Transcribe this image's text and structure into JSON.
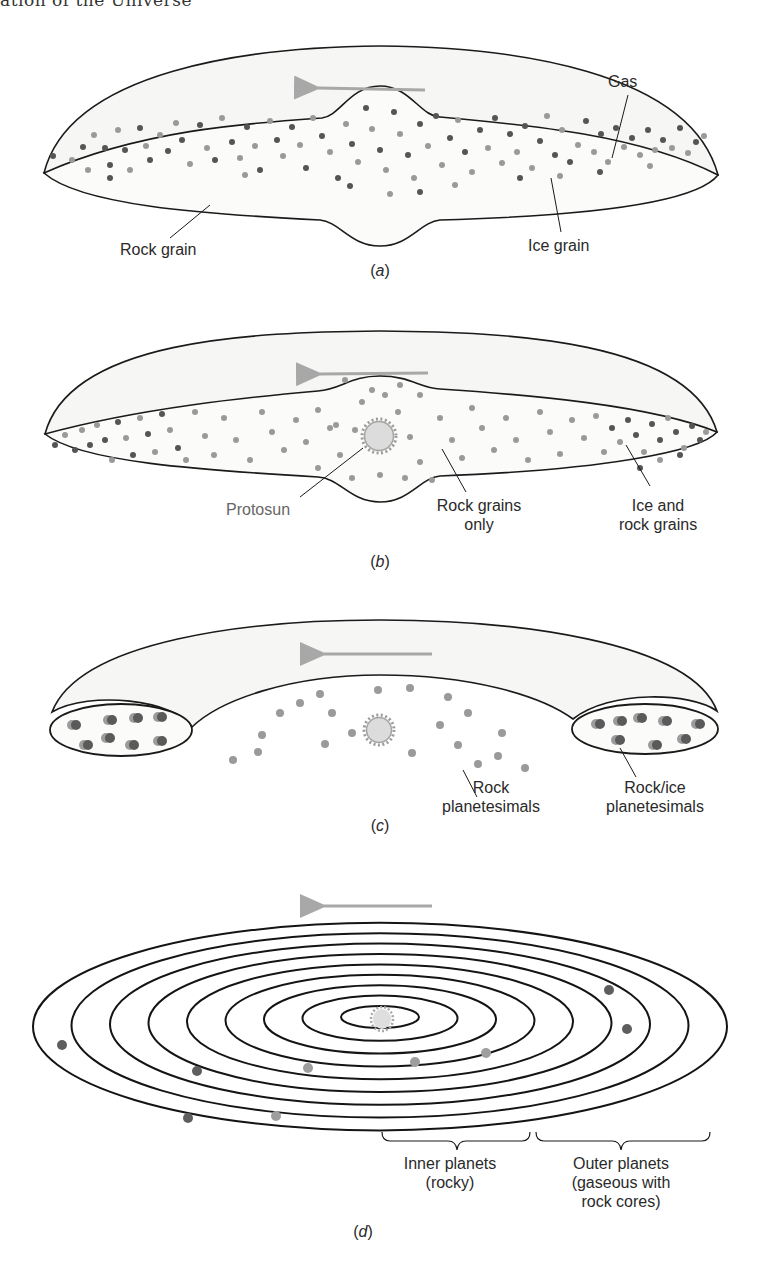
{
  "header": {
    "running_title": "ation of the Universe"
  },
  "colors": {
    "outline": "#1a1a1a",
    "gas_fill": "#f6f6f4",
    "disk_fill": "#fbfbfa",
    "rock_grain": "#9a9a9a",
    "ice_grain": "#555555",
    "arrow": "#a8a8a8",
    "protosun_fill": "#dcdcdc",
    "protosun_rim": "#9c9c9c",
    "label_text": "#2a2a2a",
    "protosun_label_text": "#666666"
  },
  "panels": [
    {
      "id": "a",
      "caption_prefix": "(",
      "caption_letter": "a",
      "caption_suffix": ")",
      "labels": {
        "gas": "Gas",
        "rock_grain": "Rock grain",
        "ice_grain": "Ice grain"
      },
      "rotation_arrow": "counterclockwise (pointing left)"
    },
    {
      "id": "b",
      "caption_prefix": "(",
      "caption_letter": "b",
      "caption_suffix": ")",
      "labels": {
        "protosun": "Protosun",
        "rock_only_line1": "Rock grains",
        "rock_only_line2": "only",
        "ice_rock_line1": "Ice and",
        "ice_rock_line2": "rock grains"
      }
    },
    {
      "id": "c",
      "caption_prefix": "(",
      "caption_letter": "c",
      "caption_suffix": ")",
      "labels": {
        "rock_pl_line1": "Rock",
        "rock_pl_line2": "planetesimals",
        "rockice_pl_line1": "Rock/ice",
        "rockice_pl_line2": "planetesimals"
      }
    },
    {
      "id": "d",
      "caption_prefix": "(",
      "caption_letter": "d",
      "caption_suffix": ")",
      "orbit_count": 9,
      "labels": {
        "inner_line1": "Inner planets",
        "inner_line2": "(rocky)",
        "outer_line1": "Outer planets",
        "outer_line2": "(gaseous with",
        "outer_line3": "rock cores)"
      }
    }
  ],
  "grains_a": [
    [
      53,
      156,
      "i"
    ],
    [
      72,
      160,
      "r"
    ],
    [
      83,
      147,
      "i"
    ],
    [
      94,
      135,
      "r"
    ],
    [
      105,
      148,
      "i"
    ],
    [
      88,
      170,
      "r"
    ],
    [
      110,
      165,
      "i"
    ],
    [
      118,
      130,
      "r"
    ],
    [
      125,
      150,
      "i"
    ],
    [
      130,
      170,
      "r"
    ],
    [
      140,
      128,
      "i"
    ],
    [
      146,
      146,
      "r"
    ],
    [
      150,
      160,
      "i"
    ],
    [
      160,
      135,
      "r"
    ],
    [
      168,
      151,
      "i"
    ],
    [
      176,
      123,
      "r"
    ],
    [
      182,
      140,
      "i"
    ],
    [
      190,
      164,
      "r"
    ],
    [
      200,
      125,
      "i"
    ],
    [
      207,
      148,
      "r"
    ],
    [
      215,
      160,
      "i"
    ],
    [
      222,
      118,
      "r"
    ],
    [
      232,
      142,
      "i"
    ],
    [
      240,
      158,
      "r"
    ],
    [
      247,
      127,
      "i"
    ],
    [
      255,
      146,
      "r"
    ],
    [
      260,
      170,
      "i"
    ],
    [
      270,
      121,
      "r"
    ],
    [
      277,
      140,
      "i"
    ],
    [
      283,
      156,
      "r"
    ],
    [
      292,
      127,
      "i"
    ],
    [
      300,
      145,
      "r"
    ],
    [
      306,
      168,
      "i"
    ],
    [
      313,
      118,
      "r"
    ],
    [
      322,
      136,
      "i"
    ],
    [
      330,
      152,
      "r"
    ],
    [
      338,
      178,
      "i"
    ],
    [
      346,
      124,
      "r"
    ],
    [
      352,
      144,
      "i"
    ],
    [
      358,
      162,
      "r"
    ],
    [
      366,
      108,
      "i"
    ],
    [
      372,
      129,
      "r"
    ],
    [
      380,
      150,
      "i"
    ],
    [
      386,
      170,
      "r"
    ],
    [
      394,
      112,
      "i"
    ],
    [
      400,
      134,
      "r"
    ],
    [
      408,
      155,
      "i"
    ],
    [
      414,
      178,
      "r"
    ],
    [
      420,
      124,
      "i"
    ],
    [
      428,
      146,
      "r"
    ],
    [
      436,
      116,
      "i"
    ],
    [
      442,
      165,
      "r"
    ],
    [
      450,
      138,
      "i"
    ],
    [
      458,
      120,
      "r"
    ],
    [
      465,
      152,
      "i"
    ],
    [
      472,
      172,
      "r"
    ],
    [
      480,
      130,
      "i"
    ],
    [
      488,
      148,
      "r"
    ],
    [
      495,
      118,
      "i"
    ],
    [
      502,
      163,
      "r"
    ],
    [
      510,
      134,
      "i"
    ],
    [
      517,
      152,
      "r"
    ],
    [
      525,
      126,
      "i"
    ],
    [
      532,
      168,
      "r"
    ],
    [
      540,
      141,
      "i"
    ],
    [
      547,
      116,
      "r"
    ],
    [
      555,
      155,
      "i"
    ],
    [
      562,
      130,
      "r"
    ],
    [
      570,
      162,
      "i"
    ],
    [
      578,
      145,
      "r"
    ],
    [
      586,
      121,
      "i"
    ],
    [
      594,
      152,
      "r"
    ],
    [
      601,
      134,
      "i"
    ],
    [
      608,
      162,
      "r"
    ],
    [
      616,
      128,
      "i"
    ],
    [
      624,
      147,
      "r"
    ],
    [
      632,
      138,
      "i"
    ],
    [
      640,
      155,
      "r"
    ],
    [
      648,
      130,
      "i"
    ],
    [
      655,
      150,
      "r"
    ],
    [
      663,
      140,
      "i"
    ],
    [
      672,
      148,
      "r"
    ],
    [
      680,
      128,
      "i"
    ],
    [
      688,
      153,
      "r"
    ],
    [
      696,
      142,
      "i"
    ],
    [
      704,
      136,
      "r"
    ],
    [
      110,
      178,
      "i"
    ],
    [
      245,
      175,
      "r"
    ],
    [
      350,
      186,
      "i"
    ],
    [
      390,
      194,
      "r"
    ],
    [
      420,
      192,
      "i"
    ],
    [
      455,
      185,
      "r"
    ],
    [
      520,
      178,
      "i"
    ],
    [
      560,
      176,
      "r"
    ],
    [
      600,
      172,
      "i"
    ],
    [
      650,
      166,
      "r"
    ]
  ],
  "grains_b": [
    [
      55,
      445,
      "i"
    ],
    [
      65,
      435,
      "r"
    ],
    [
      75,
      450,
      "i"
    ],
    [
      82,
      430,
      "r"
    ],
    [
      90,
      445,
      "i"
    ],
    [
      97,
      425,
      "r"
    ],
    [
      105,
      440,
      "i"
    ],
    [
      112,
      460,
      "r"
    ],
    [
      118,
      422,
      "i"
    ],
    [
      126,
      438,
      "r"
    ],
    [
      133,
      455,
      "i"
    ],
    [
      140,
      418,
      "r"
    ],
    [
      148,
      434,
      "i"
    ],
    [
      155,
      452,
      "r"
    ],
    [
      162,
      414,
      "i"
    ],
    [
      170,
      430,
      "r"
    ],
    [
      178,
      448,
      "i"
    ],
    [
      186,
      460,
      "r"
    ],
    [
      195,
      412,
      "r"
    ],
    [
      205,
      436,
      "r"
    ],
    [
      214,
      455,
      "r"
    ],
    [
      224,
      418,
      "r"
    ],
    [
      236,
      440,
      "r"
    ],
    [
      250,
      460,
      "r"
    ],
    [
      262,
      412,
      "r"
    ],
    [
      272,
      432,
      "r"
    ],
    [
      284,
      450,
      "r"
    ],
    [
      296,
      420,
      "r"
    ],
    [
      306,
      442,
      "r"
    ],
    [
      318,
      410,
      "r"
    ],
    [
      330,
      428,
      "r"
    ],
    [
      340,
      455,
      "r"
    ],
    [
      352,
      478,
      "r"
    ],
    [
      362,
      402,
      "r"
    ],
    [
      372,
      390,
      "r"
    ],
    [
      385,
      395,
      "r"
    ],
    [
      398,
      412,
      "r"
    ],
    [
      410,
      437,
      "r"
    ],
    [
      420,
      462,
      "r"
    ],
    [
      432,
      480,
      "r"
    ],
    [
      440,
      418,
      "r"
    ],
    [
      452,
      440,
      "r"
    ],
    [
      462,
      458,
      "r"
    ],
    [
      472,
      408,
      "r"
    ],
    [
      482,
      428,
      "r"
    ],
    [
      494,
      450,
      "r"
    ],
    [
      506,
      418,
      "r"
    ],
    [
      516,
      440,
      "r"
    ],
    [
      528,
      460,
      "r"
    ],
    [
      540,
      412,
      "r"
    ],
    [
      550,
      432,
      "r"
    ],
    [
      560,
      454,
      "r"
    ],
    [
      572,
      420,
      "r"
    ],
    [
      584,
      438,
      "r"
    ],
    [
      596,
      416,
      "r"
    ],
    [
      604,
      452,
      "r"
    ],
    [
      612,
      428,
      "i"
    ],
    [
      620,
      442,
      "r"
    ],
    [
      628,
      420,
      "i"
    ],
    [
      636,
      435,
      "i"
    ],
    [
      644,
      452,
      "r"
    ],
    [
      652,
      424,
      "i"
    ],
    [
      660,
      440,
      "i"
    ],
    [
      668,
      418,
      "r"
    ],
    [
      676,
      432,
      "i"
    ],
    [
      684,
      448,
      "r"
    ],
    [
      692,
      426,
      "i"
    ],
    [
      700,
      440,
      "i"
    ],
    [
      706,
      432,
      "r"
    ],
    [
      640,
      468,
      "i"
    ],
    [
      660,
      460,
      "r"
    ],
    [
      680,
      455,
      "i"
    ],
    [
      336,
      425,
      "r"
    ],
    [
      355,
      430,
      "r"
    ],
    [
      400,
      385,
      "r"
    ],
    [
      345,
      380,
      "r"
    ],
    [
      420,
      395,
      "r"
    ],
    [
      380,
      475,
      "r"
    ],
    [
      405,
      478,
      "r"
    ],
    [
      318,
      468,
      "r"
    ]
  ],
  "planetesimals_c_rock": [
    [
      233,
      760
    ],
    [
      258,
      752
    ],
    [
      262,
      735
    ],
    [
      280,
      713
    ],
    [
      300,
      703
    ],
    [
      320,
      694
    ],
    [
      332,
      713
    ],
    [
      325,
      744
    ],
    [
      352,
      733
    ],
    [
      378,
      690
    ],
    [
      410,
      688
    ],
    [
      412,
      753
    ],
    [
      440,
      725
    ],
    [
      448,
      697
    ],
    [
      458,
      745
    ],
    [
      468,
      713
    ],
    [
      478,
      764
    ],
    [
      498,
      756
    ],
    [
      502,
      733
    ],
    [
      525,
      768
    ]
  ],
  "planetesimals_c_mixed": [
    [
      74,
      725
    ],
    [
      110,
      720
    ],
    [
      136,
      718
    ],
    [
      160,
      717
    ],
    [
      86,
      745
    ],
    [
      108,
      738
    ],
    [
      132,
      745
    ],
    [
      160,
      741
    ],
    [
      598,
      724
    ],
    [
      620,
      721
    ],
    [
      640,
      718
    ],
    [
      665,
      721
    ],
    [
      698,
      724
    ],
    [
      618,
      740
    ],
    [
      655,
      745
    ],
    [
      684,
      739
    ]
  ],
  "planets_d": [
    [
      62,
      1045,
      "i"
    ],
    [
      197,
      1071,
      "i"
    ],
    [
      188,
      1118,
      "i"
    ],
    [
      276,
      1116,
      "r"
    ],
    [
      308,
      1068,
      "r"
    ],
    [
      415,
      1062,
      "r"
    ],
    [
      486,
      1053,
      "r"
    ],
    [
      609,
      990,
      "i"
    ],
    [
      627,
      1029,
      "i"
    ]
  ]
}
